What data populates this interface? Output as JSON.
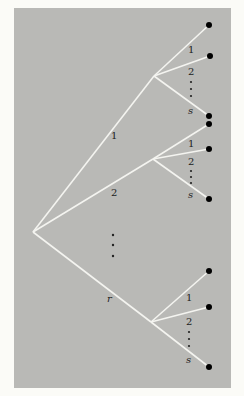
{
  "diagram": {
    "type": "tree",
    "colors": {
      "background": "#fbfbf7",
      "panel": "#b9b9b6",
      "edge": "#f4f4f0",
      "node": "#000000",
      "text": "#222222"
    },
    "root": {
      "x": 33,
      "y": 232
    },
    "first_level": {
      "labels": [
        "1",
        "2",
        "r"
      ],
      "ellipsis": "⋮"
    },
    "second_level": {
      "labels": [
        "1",
        "2",
        "s"
      ],
      "ellipsis": "⋮"
    },
    "subtrees": [
      {
        "label": "1",
        "node": {
          "x": 154,
          "y": 76
        },
        "leaves": [
          {
            "x": 209,
            "y": 25
          },
          {
            "x": 210,
            "y": 56
          },
          {
            "x": 209,
            "y": 116
          }
        ]
      },
      {
        "label": "2",
        "node": {
          "x": 153,
          "y": 159
        },
        "leaves": [
          {
            "x": 209,
            "y": 124
          },
          {
            "x": 209,
            "y": 149
          },
          {
            "x": 209,
            "y": 199
          }
        ]
      },
      {
        "label": "r",
        "node": {
          "x": 151,
          "y": 322
        },
        "leaves": [
          {
            "x": 209,
            "y": 271
          },
          {
            "x": 209,
            "y": 307
          },
          {
            "x": 209,
            "y": 367
          }
        ]
      }
    ]
  }
}
